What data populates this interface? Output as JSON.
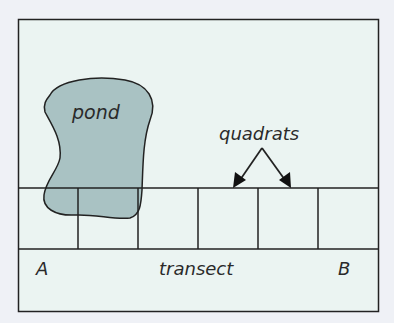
{
  "diagram": {
    "labels": {
      "pond": "pond",
      "quadrats": "quadrats",
      "transect": "transect",
      "end_a": "A",
      "end_b": "B"
    },
    "quadrat_count": 6,
    "colors": {
      "background": "#eff1f6",
      "frame_fill": "#ebf4f2",
      "pond_fill": "#a9c2c3",
      "line": "#222222"
    }
  }
}
